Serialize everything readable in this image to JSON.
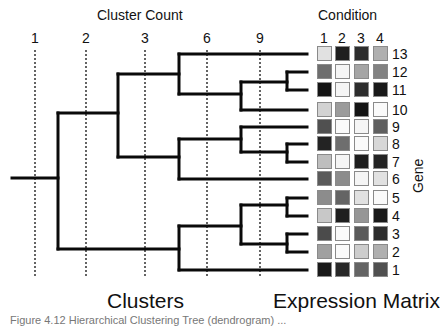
{
  "header": {
    "cluster_count_title": "Cluster Count",
    "condition_title": "Condition"
  },
  "cluster_ticks": [
    {
      "label": "1",
      "x": 35
    },
    {
      "label": "2",
      "x": 86
    },
    {
      "label": "3",
      "x": 145
    },
    {
      "label": "6",
      "x": 207
    },
    {
      "label": "9",
      "x": 260
    }
  ],
  "conditions": [
    "1",
    "2",
    "3",
    "4"
  ],
  "genes_top_to_bottom": [
    "13",
    "12",
    "11",
    "10",
    "9",
    "8",
    "7",
    "6",
    "5",
    "4",
    "3",
    "2",
    "1"
  ],
  "gene_axis_label": "Gene",
  "footer": {
    "clusters_label": "Clusters",
    "matrix_label": "Expression Matrix",
    "caption": "Figure 4.12  Hierarchical Clustering Tree (dendrogram) ..."
  },
  "chart_data": {
    "type": "heatmap",
    "xlabel": "Condition",
    "ylabel": "Gene",
    "columns": [
      "1",
      "2",
      "3",
      "4"
    ],
    "rows": [
      "13",
      "12",
      "11",
      "10",
      "9",
      "8",
      "7",
      "6",
      "5",
      "4",
      "3",
      "2",
      "1"
    ],
    "grayscale_values_0_black_255_white": [
      [
        225,
        30,
        45,
        175
      ],
      [
        110,
        245,
        165,
        130
      ],
      [
        20,
        245,
        45,
        25
      ],
      [
        210,
        155,
        20,
        250
      ],
      [
        80,
        250,
        245,
        95
      ],
      [
        35,
        110,
        250,
        215
      ],
      [
        190,
        245,
        30,
        35
      ],
      [
        90,
        140,
        245,
        225
      ],
      [
        140,
        100,
        225,
        250
      ],
      [
        200,
        30,
        150,
        25
      ],
      [
        75,
        250,
        90,
        45
      ],
      [
        160,
        250,
        205,
        175
      ],
      [
        25,
        40,
        100,
        80
      ]
    ],
    "dendrogram": {
      "cut_levels": [
        "1",
        "2",
        "3",
        "6",
        "9"
      ],
      "tree": "((13,((12,11),10)),(9,(8,7)),6),(((5,4),(3,2)),1)"
    }
  }
}
